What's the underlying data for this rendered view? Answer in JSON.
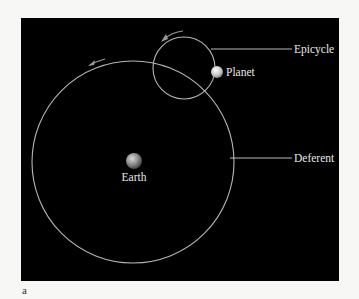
{
  "figure": {
    "panel_label": "a",
    "colors": {
      "page_background": "#f7f7f5",
      "panel_background": "#000000",
      "orbit_line": "#b5b5b5",
      "leader_line": "#d0d0d0",
      "label_text": "#e8e8e8"
    },
    "labels": {
      "epicycle": "Epicycle",
      "planet": "Planet",
      "deferent": "Deferent",
      "earth": "Earth"
    },
    "elements": {
      "deferent_circle": {
        "cx": 133,
        "cy": 162,
        "r": 101
      },
      "epicycle_circle": {
        "cx": 184,
        "cy": 68,
        "r": 31
      },
      "earth": {
        "cx": 134,
        "cy": 161,
        "r": 8
      },
      "planet": {
        "cx": 217,
        "cy": 72,
        "r": 6
      }
    },
    "arrows": [
      {
        "name": "deferent-direction",
        "direction": "counterclockwise"
      },
      {
        "name": "epicycle-direction",
        "direction": "counterclockwise"
      }
    ]
  }
}
